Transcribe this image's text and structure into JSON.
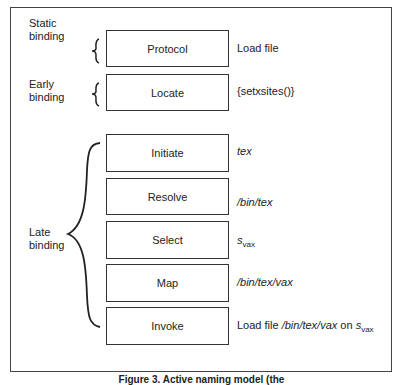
{
  "figure": {
    "caption": "Figure 3. Active naming model (the"
  },
  "groups": [
    {
      "label_line1": "Static",
      "label_line2": "binding"
    },
    {
      "label_line1": "Early",
      "label_line2": "binding"
    },
    {
      "label_line1": "Late",
      "label_line2": "binding"
    }
  ],
  "steps": [
    {
      "name": "Protocol",
      "desc": "Load file"
    },
    {
      "name": "Locate",
      "desc": "{setxsites()}"
    },
    {
      "name": "Initiate",
      "desc": "tex"
    },
    {
      "name": "Resolve",
      "desc": "/bin/tex"
    },
    {
      "name": "Select",
      "desc_base": "s",
      "desc_sub": "vax"
    },
    {
      "name": "Map",
      "desc": "/bin/tex/vax"
    },
    {
      "name": "Invoke",
      "desc_prefix": "Load file ",
      "desc_path": "/bin/tex/vax",
      "desc_mid": " on ",
      "desc_base": "s",
      "desc_sub": "vax"
    }
  ]
}
